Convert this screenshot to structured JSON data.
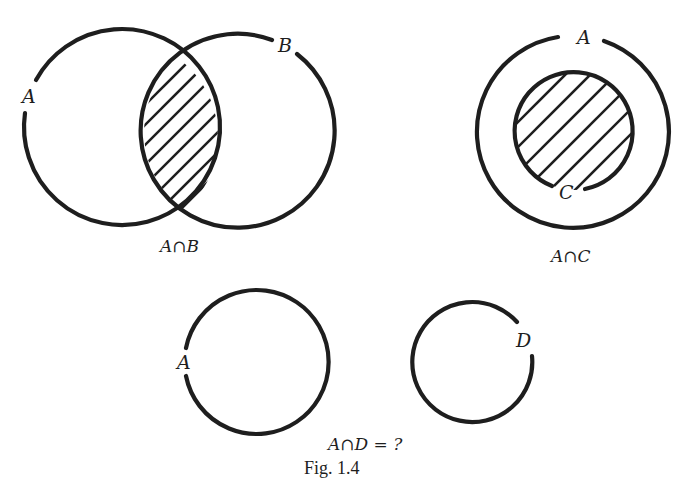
{
  "figure": {
    "caption": "Fig. 1.4",
    "panels": [
      {
        "id": "a-intersect-b",
        "caption": "A∩B",
        "sets": [
          {
            "label": "A",
            "cx": 120,
            "cy": 137,
            "r": 98
          },
          {
            "label": "B",
            "cx": 241,
            "cy": 132,
            "r": 97
          }
        ],
        "shaded_region": "intersection of A and B (hatched)"
      },
      {
        "id": "a-intersect-c",
        "caption": "A∩C",
        "sets": [
          {
            "label": "A",
            "cx": 573,
            "cy": 132,
            "r": 96
          },
          {
            "label": "C",
            "cx": 574,
            "cy": 131,
            "r": 59
          }
        ],
        "shaded_region": "C entirely inside A (hatched)"
      },
      {
        "id": "a-intersect-d",
        "caption": "A∩D = ?",
        "sets": [
          {
            "label": "A",
            "cx": 256,
            "cy": 365,
            "r": 72
          },
          {
            "label": "D",
            "cx": 477,
            "cy": 369,
            "r": 60
          }
        ],
        "shaded_region": "none (disjoint sets)"
      }
    ],
    "labels": {
      "p1_a": "A",
      "p1_b": "B",
      "p1_caption": "A∩B",
      "p2_a": "A",
      "p2_c": "C",
      "p2_caption": "A∩C",
      "p3_a": "A",
      "p3_d": "D",
      "p3_caption": "A∩D = ?",
      "fig_caption": "Fig. 1.4"
    }
  }
}
